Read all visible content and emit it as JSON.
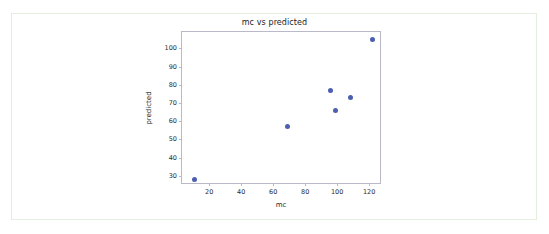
{
  "chart_data": {
    "type": "scatter",
    "title": "mc vs predicted",
    "xlabel": "mc",
    "ylabel": "predicted",
    "xlim": [
      3,
      128
    ],
    "ylim": [
      25,
      109
    ],
    "xticks": [
      20,
      40,
      60,
      80,
      100,
      120
    ],
    "yticks": [
      30,
      40,
      50,
      60,
      70,
      80,
      90,
      100
    ],
    "xtick_labels": [
      "20",
      "40",
      "60",
      "80",
      "100",
      "120"
    ],
    "ytick_labels": [
      "30",
      "40",
      "50",
      "60",
      "70",
      "80",
      "90",
      "100"
    ],
    "grid": false,
    "legend": null,
    "marker_color": "#4c5fae",
    "series": [
      {
        "name": "predicted",
        "x": [
          11,
          69,
          96,
          99,
          108,
          122
        ],
        "y": [
          28,
          57,
          77,
          66,
          73,
          105
        ]
      }
    ]
  },
  "figure": {
    "frame_color": "#e3efdc",
    "axes_color": "#b9b9c9"
  }
}
